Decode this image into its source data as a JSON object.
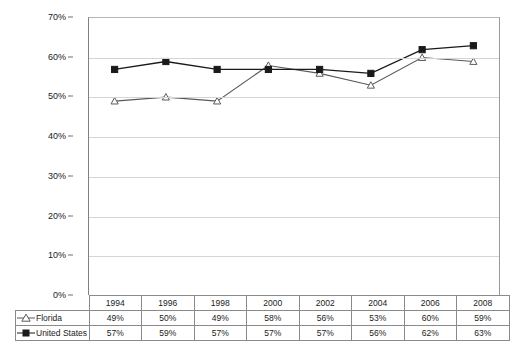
{
  "chart_data": {
    "type": "line",
    "title": "",
    "subtitle": "",
    "xlabel": "",
    "ylabel": "",
    "categories": [
      "1994",
      "1996",
      "1998",
      "2000",
      "2002",
      "2004",
      "2006",
      "2008"
    ],
    "series": [
      {
        "name": "Florida",
        "marker": "open-triangle",
        "color": "#595959",
        "values": [
          49,
          50,
          49,
          58,
          56,
          53,
          60,
          59
        ],
        "labels": [
          "49%",
          "50%",
          "49%",
          "58%",
          "56%",
          "53%",
          "60%",
          "59%"
        ]
      },
      {
        "name": "United States",
        "marker": "filled-square",
        "color": "#1a1a1a",
        "values": [
          57,
          59,
          57,
          57,
          57,
          56,
          62,
          63
        ],
        "labels": [
          "57%",
          "59%",
          "57%",
          "57%",
          "57%",
          "56%",
          "62%",
          "63%"
        ]
      }
    ],
    "ylim": [
      0,
      70
    ],
    "ytick_step": 10,
    "ytick_labels": [
      "0%",
      "10%",
      "20%",
      "30%",
      "40%",
      "50%",
      "60%",
      "70%"
    ],
    "grid": true,
    "legend_position": "data-table-left"
  },
  "axis": {
    "y_ticks": [
      "70%",
      "60%",
      "50%",
      "40%",
      "30%",
      "20%",
      "10%",
      "0%"
    ]
  },
  "table": {
    "years": [
      "1994",
      "1996",
      "1998",
      "2000",
      "2002",
      "2004",
      "2006",
      "2008"
    ],
    "rows": [
      {
        "label": "Florida",
        "marker": "open-triangle",
        "values": [
          "49%",
          "50%",
          "49%",
          "58%",
          "56%",
          "53%",
          "60%",
          "59%"
        ]
      },
      {
        "label": "United States",
        "marker": "filled-square",
        "values": [
          "57%",
          "59%",
          "57%",
          "57%",
          "57%",
          "56%",
          "62%",
          "63%"
        ]
      }
    ]
  },
  "colors": {
    "florida_line": "#595959",
    "us_line": "#1a1a1a",
    "gridline": "#d4d4d4",
    "axis": "#808080",
    "table_border": "#8a8a8a",
    "background": "#ffffff"
  }
}
